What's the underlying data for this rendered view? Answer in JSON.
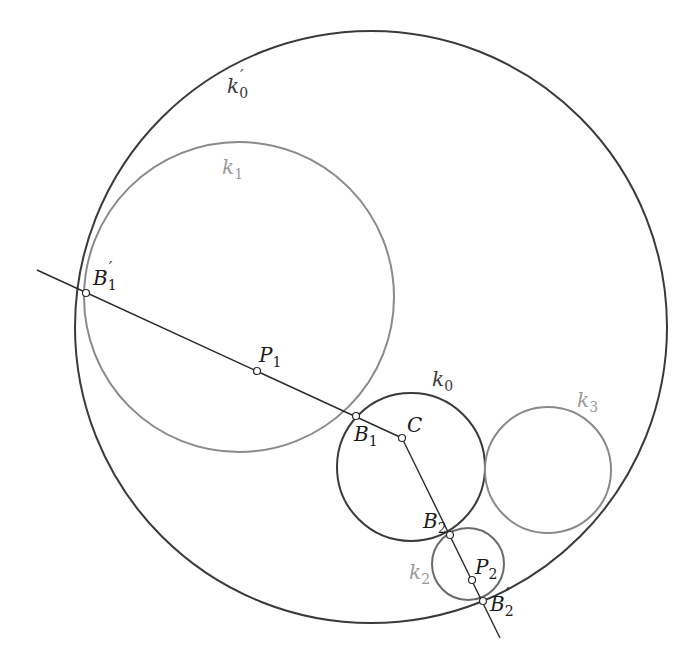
{
  "figure": {
    "type": "geometric construction: inversion of tangent circles",
    "colors": {
      "dark": "#3a3a3a",
      "gray": "#7a7a7a",
      "light_label": "#9a9a9a",
      "point_fill": "#ffffff"
    }
  },
  "circles": [
    {
      "id": "k0prime",
      "label": "k",
      "sub": "0",
      "prime": true,
      "style": "dark"
    },
    {
      "id": "k1",
      "label": "k",
      "sub": "1",
      "prime": false,
      "style": "gray"
    },
    {
      "id": "k0",
      "label": "k",
      "sub": "0",
      "prime": false,
      "style": "dark"
    },
    {
      "id": "k3",
      "label": "k",
      "sub": "3",
      "prime": false,
      "style": "gray"
    },
    {
      "id": "k2",
      "label": "k",
      "sub": "2",
      "prime": false,
      "style": "gray"
    }
  ],
  "points": [
    {
      "id": "B1prime",
      "label": "B",
      "sub": "1",
      "prime": true
    },
    {
      "id": "P1",
      "label": "P",
      "sub": "1",
      "prime": false
    },
    {
      "id": "B1",
      "label": "B",
      "sub": "1",
      "prime": false
    },
    {
      "id": "C",
      "label": "C",
      "sub": "",
      "prime": false
    },
    {
      "id": "B2",
      "label": "B",
      "sub": "2",
      "prime": false
    },
    {
      "id": "P2",
      "label": "P",
      "sub": "2",
      "prime": false
    },
    {
      "id": "B2prime",
      "label": "B",
      "sub": "2",
      "prime": true
    }
  ],
  "lines": [
    {
      "id": "line-through-B1prime-C",
      "from": "B1prime",
      "to": "C"
    },
    {
      "id": "line-through-C-B2prime",
      "from": "C",
      "to": "B2prime"
    }
  ]
}
